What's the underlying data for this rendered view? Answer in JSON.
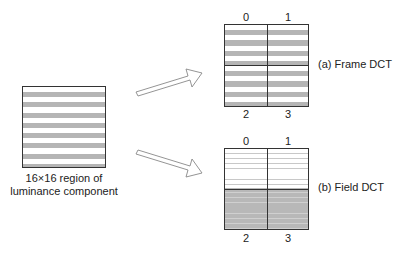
{
  "source": {
    "caption_line1": "16×16 region of",
    "caption_line2": "luminance component"
  },
  "frame_dct": {
    "label": "(a) Frame DCT",
    "blocks": [
      "0",
      "1",
      "2",
      "3"
    ]
  },
  "field_dct": {
    "label": "(b) Field DCT",
    "blocks": [
      "0",
      "1",
      "2",
      "3"
    ]
  },
  "colors": {
    "stripe_gray": "#b5b5b5",
    "field_gray": "#b8b8b8",
    "border": "#333333"
  }
}
